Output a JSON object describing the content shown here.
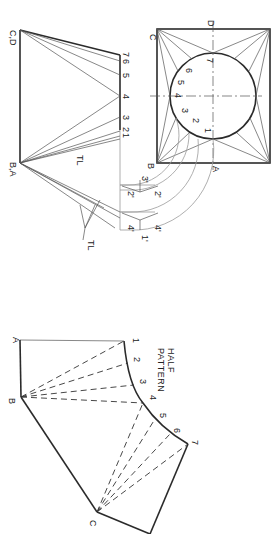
{
  "drawing": {
    "type": "sheet metal transition piece development",
    "orientation": "rotated 90 degrees clockwise",
    "plan_view": {
      "corner_labels": [
        "C",
        "D",
        "B",
        "A"
      ],
      "circle_points": [
        "1",
        "2",
        "3",
        "4",
        "5",
        "6",
        "7"
      ]
    },
    "elevation_view": {
      "top_label": "C,D",
      "bottom_label": "B,A",
      "true_length_points": [
        "7",
        "6",
        "5",
        "4",
        "3",
        "2",
        "1"
      ],
      "true_length_label": "TL",
      "arc_points": [
        "3'",
        "2'",
        "2'",
        "4'",
        "4'",
        "1'"
      ],
      "arc_true_length_label": "TL"
    },
    "half_pattern": {
      "title_line1": "HALF",
      "title_line2": "PATTERN",
      "corner_labels": [
        "A",
        "B",
        "C"
      ],
      "curve_points": [
        "1",
        "2",
        "3",
        "4",
        "5",
        "6",
        "7"
      ]
    }
  },
  "colors": {
    "line": "#2b2b2b",
    "construction": "#555555",
    "arc": "#9a9a9a",
    "background": "#ffffff"
  }
}
